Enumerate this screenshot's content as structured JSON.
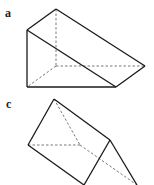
{
  "figures": [
    {
      "label": "a",
      "shape": "triangular-prism",
      "solid_edges": [
        [
          [
            56,
            9
          ],
          [
            27,
            30
          ]
        ],
        [
          [
            56,
            9
          ],
          [
            145,
            66
          ]
        ],
        [
          [
            27,
            30
          ],
          [
            116,
            87
          ]
        ],
        [
          [
            27,
            30
          ],
          [
            27,
            87
          ]
        ],
        [
          [
            27,
            87
          ],
          [
            116,
            87
          ]
        ],
        [
          [
            116,
            87
          ],
          [
            145,
            66
          ]
        ]
      ],
      "hidden_edges": [
        [
          [
            56,
            9
          ],
          [
            56,
            66
          ]
        ],
        [
          [
            56,
            66
          ],
          [
            27,
            87
          ]
        ],
        [
          [
            56,
            66
          ],
          [
            145,
            66
          ]
        ]
      ]
    },
    {
      "label": "c",
      "shape": "triangular-prism",
      "solid_edges": [
        [
          [
            54,
            99
          ],
          [
            28,
            145
          ]
        ],
        [
          [
            28,
            145
          ],
          [
            84,
            185
          ]
        ],
        [
          [
            54,
            99
          ],
          [
            110,
            140
          ]
        ],
        [
          [
            110,
            140
          ],
          [
            84,
            185
          ]
        ],
        [
          [
            110,
            140
          ],
          [
            137,
            185
          ]
        ]
      ],
      "hidden_edges": [
        [
          [
            28,
            145
          ],
          [
            80,
            145
          ]
        ],
        [
          [
            54,
            99
          ],
          [
            80,
            145
          ]
        ],
        [
          [
            80,
            145
          ],
          [
            137,
            185
          ]
        ]
      ]
    }
  ],
  "colors": {
    "line": "#1a1a1a",
    "hidden": "#555555",
    "background": "#ffffff"
  }
}
